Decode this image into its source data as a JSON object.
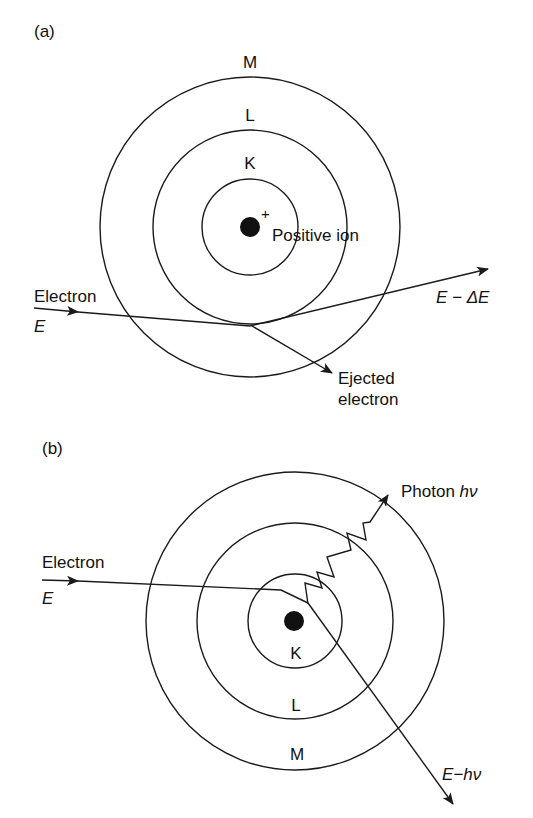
{
  "panels": [
    {
      "id": "a",
      "label": "(a)",
      "process": "ionization",
      "shells": {
        "inner": "K",
        "middle": "L",
        "outer": "M"
      },
      "nucleus_sign": "+",
      "nucleus_label": "Positive ion",
      "incoming": {
        "label": "Electron",
        "energy": "E"
      },
      "outgoing": {
        "energy": "E − ΔE"
      },
      "ejected": {
        "line1": "Ejected",
        "line2": "electron"
      }
    },
    {
      "id": "b",
      "label": "(b)",
      "process": "bremsstrahlung",
      "shells": {
        "inner": "K",
        "middle": "L",
        "outer": "M"
      },
      "incoming": {
        "label": "Electron",
        "energy": "E"
      },
      "photon": {
        "label": "Photon ",
        "symbol": "hν"
      },
      "outgoing": {
        "energy": "E−hν"
      }
    }
  ],
  "colors": {
    "ink": "#1a1a1a",
    "background": "#ffffff"
  }
}
